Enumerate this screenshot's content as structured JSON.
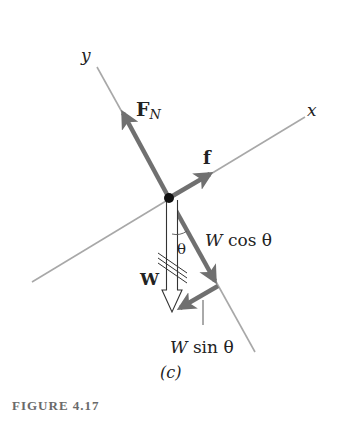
{
  "figure": {
    "caption": "FIGURE 4.17",
    "panel_label": "(c)",
    "type": "free-body diagram on incline (rotated axes)"
  },
  "axes": {
    "x_label": "x",
    "y_label": "y"
  },
  "vectors": {
    "normal_force": {
      "label_main": "F",
      "label_sub": "N"
    },
    "friction": {
      "label": "f"
    },
    "weight": {
      "label": "W"
    },
    "weight_perp": {
      "label_w": "W",
      "label_rest": "cos θ"
    },
    "weight_parallel": {
      "label_w": "W",
      "label_rest": "sin θ"
    }
  },
  "angle": {
    "label": "θ"
  },
  "colors": {
    "axis": "#a8a8a8",
    "vector": "#707070",
    "dot": "#111111",
    "caption": "#6a6a6a"
  }
}
